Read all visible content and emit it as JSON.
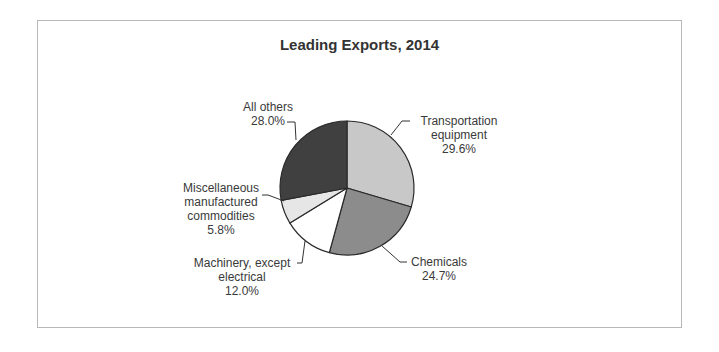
{
  "chart_data": {
    "type": "pie",
    "title": "Leading Exports, 2014",
    "categories": [
      "Transportation equipment",
      "Chemicals",
      "Machinery, except electrical",
      "Miscellaneous manufactured commodities",
      "All others"
    ],
    "values": [
      29.6,
      24.7,
      12.0,
      5.8,
      28.0
    ],
    "unit": "%",
    "colors": [
      "#c8c8c8",
      "#8c8c8c",
      "#ffffff",
      "#e6e6e6",
      "#404040"
    ],
    "start_angle": "12 o'clock",
    "direction": "clockwise",
    "legend": "none (leader-line data labels)",
    "grid": false
  },
  "title": "Leading Exports, 2014",
  "labels": {
    "transportation": {
      "line1": "Transportation",
      "line2": "equipment",
      "value": "29.6%"
    },
    "chemicals": {
      "line1": "Chemicals",
      "value": "24.7%"
    },
    "machinery": {
      "line1": "Machinery, except",
      "line2": "electrical",
      "value": "12.0%"
    },
    "misc": {
      "line1": "Miscellaneous",
      "line2": "manufactured",
      "line3": "commodities",
      "value": "5.8%"
    },
    "others": {
      "line1": "All others",
      "value": "28.0%"
    }
  }
}
